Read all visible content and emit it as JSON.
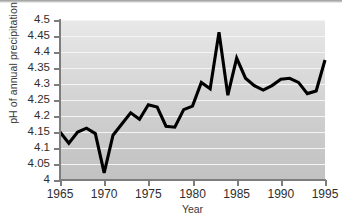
{
  "chart_data": {
    "type": "line",
    "title": "",
    "xlabel": "Year",
    "ylabel": "pH of annual precipitation",
    "xlim": [
      1965,
      1995
    ],
    "ylim": [
      4,
      4.5
    ],
    "grid": true,
    "legend": null,
    "line_color": "#000000",
    "background_gradient": [
      "#e8e8e8",
      "#c2c2c2"
    ],
    "gridline_color": "#f4f4f4",
    "axis_color": "#7d7d7d",
    "xticks": [
      1965,
      1970,
      1975,
      1980,
      1985,
      1990,
      1995
    ],
    "xtick_labels": [
      "1965",
      "1970",
      "1975",
      "1980",
      "1985",
      "1990",
      "1995"
    ],
    "yticks": [
      4,
      4.05,
      4.1,
      4.15,
      4.2,
      4.25,
      4.3,
      4.35,
      4.4,
      4.45,
      4.5
    ],
    "ytick_labels": [
      "4",
      "4.05",
      "4.1",
      "4.15",
      "4.2",
      "4.25",
      "4.3",
      "4.35",
      "4.4",
      "4.45",
      "4.5"
    ],
    "x": [
      1965,
      1966,
      1967,
      1968,
      1969,
      1970,
      1971,
      1972,
      1973,
      1974,
      1975,
      1976,
      1977,
      1978,
      1979,
      1980,
      1981,
      1982,
      1983,
      1984,
      1985,
      1986,
      1987,
      1988,
      1989,
      1990,
      1991,
      1992,
      1993,
      1994,
      1995
    ],
    "values": [
      4.15,
      4.115,
      4.15,
      4.162,
      4.145,
      4.022,
      4.14,
      4.175,
      4.21,
      4.19,
      4.235,
      4.228,
      4.168,
      4.165,
      4.22,
      4.231,
      4.305,
      4.285,
      4.462,
      4.265,
      4.381,
      4.318,
      4.295,
      4.281,
      4.295,
      4.315,
      4.318,
      4.305,
      4.27,
      4.278,
      4.375
    ]
  }
}
